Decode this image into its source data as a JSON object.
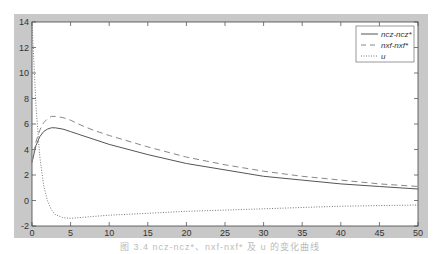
{
  "chart_data": {
    "type": "line",
    "title": "",
    "xlabel": "",
    "ylabel": "",
    "xlim": [
      0,
      50
    ],
    "ylim": [
      -2,
      14
    ],
    "grid": false,
    "legend_position": "upper right",
    "x_ticks": [
      0,
      5,
      10,
      15,
      20,
      25,
      30,
      35,
      40,
      45,
      50
    ],
    "y_ticks": [
      -2,
      0,
      2,
      4,
      6,
      8,
      10,
      12,
      14
    ],
    "x": [
      0,
      0.5,
      1,
      1.5,
      2,
      2.5,
      3,
      4,
      5,
      6,
      8,
      10,
      15,
      20,
      25,
      30,
      35,
      40,
      45,
      50
    ],
    "series": [
      {
        "name": "ncz-ncz*",
        "style": "solid",
        "values": [
          3.0,
          4.3,
          5.0,
          5.4,
          5.6,
          5.7,
          5.7,
          5.6,
          5.4,
          5.2,
          4.8,
          4.4,
          3.6,
          2.9,
          2.4,
          1.9,
          1.6,
          1.3,
          1.1,
          0.9
        ]
      },
      {
        "name": "nxf-nxf*",
        "style": "dashed",
        "values": [
          3.0,
          4.6,
          5.5,
          6.1,
          6.4,
          6.6,
          6.6,
          6.5,
          6.3,
          6.0,
          5.5,
          5.1,
          4.2,
          3.4,
          2.8,
          2.3,
          1.9,
          1.6,
          1.3,
          1.1
        ]
      },
      {
        "name": "u",
        "style": "dotted",
        "values": [
          14.0,
          7.5,
          3.5,
          1.2,
          0.0,
          -0.7,
          -1.1,
          -1.35,
          -1.4,
          -1.35,
          -1.25,
          -1.15,
          -1.0,
          -0.85,
          -0.75,
          -0.65,
          -0.55,
          -0.45,
          -0.4,
          -0.35
        ]
      }
    ]
  },
  "legend": {
    "items": [
      {
        "label": "ncz-ncz*"
      },
      {
        "label": "nxf-nxf*"
      },
      {
        "label": "u"
      }
    ]
  },
  "axes": {
    "x_tick_labels": [
      "0",
      "5",
      "10",
      "15",
      "20",
      "25",
      "30",
      "35",
      "40",
      "45",
      "50"
    ],
    "y_tick_labels": [
      "-2",
      "0",
      "2",
      "4",
      "6",
      "8",
      "10",
      "12",
      "14"
    ]
  },
  "caption": "图 3.4   ncz-ncz*、nxf-nxf* 及 u 的变化曲线"
}
